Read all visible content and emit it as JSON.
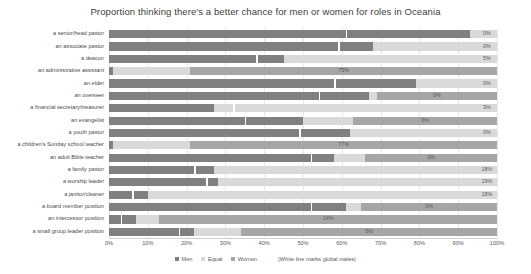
{
  "chart_data": {
    "type": "bar",
    "subtype": "stacked-horizontal-100pct",
    "title": "Proportion thinking there's a better chance for men or women for roles in Oceania",
    "xlabel": "",
    "ylabel": "",
    "xlim": [
      0,
      100
    ],
    "xticks": [
      "0%",
      "10%",
      "20%",
      "30%",
      "40%",
      "50%",
      "60%",
      "70%",
      "80%",
      "90%",
      "100%"
    ],
    "xtick_values": [
      0,
      10,
      20,
      30,
      40,
      50,
      60,
      70,
      80,
      90,
      100
    ],
    "grid": true,
    "legend_position": "bottom",
    "legend": [
      "Men",
      "Equal",
      "Women"
    ],
    "note": "(White line marks global males)",
    "colors": {
      "men": "#808080",
      "equal": "#d9d9d9",
      "women": "#a6a6a6",
      "marker": "#ffffff",
      "grid": "#e9e9e9",
      "text": "#5a5a5a"
    },
    "categories": [
      "a senior/head pastor",
      "an associate pastor",
      "a deacon",
      "an administrative assistant",
      "an elder",
      "an overseer",
      "a financial secretary/treasurer",
      "an evangelist",
      "a youth pastor",
      "a children's Sunday school teacher",
      "an adult Bible teacher",
      "a family pastor",
      "a worship leader",
      "a janitor/cleaner",
      "a board member position",
      "an intercessor position",
      "a small group leader position"
    ],
    "series": [
      {
        "name": "Men",
        "values": [
          93,
          68,
          45,
          1,
          79,
          67,
          27,
          50,
          62,
          1,
          58,
          27,
          28,
          10,
          61,
          7,
          22
        ]
      },
      {
        "name": "Equal",
        "values": [
          7,
          32,
          55,
          20,
          21,
          2,
          73,
          13,
          38,
          20,
          8,
          73,
          72,
          90,
          4,
          6,
          12
        ]
      },
      {
        "name": "Women",
        "values": [
          0,
          0,
          0,
          79,
          0,
          31,
          0,
          37,
          0,
          79,
          34,
          0,
          0,
          0,
          35,
          87,
          66
        ]
      }
    ],
    "marker_values": [
      61,
      59,
      38,
      0,
      58,
      54,
      32,
      35,
      49,
      0,
      52,
      22,
      25,
      6,
      52,
      3,
      18
    ],
    "data_labels": [
      "0%",
      "0%",
      "5%",
      "75%",
      "0%",
      "0%",
      "3%",
      "0%",
      "0%",
      "77%",
      "3%",
      "18%",
      "19%",
      "18%",
      "0%",
      "14%",
      "3%"
    ]
  }
}
